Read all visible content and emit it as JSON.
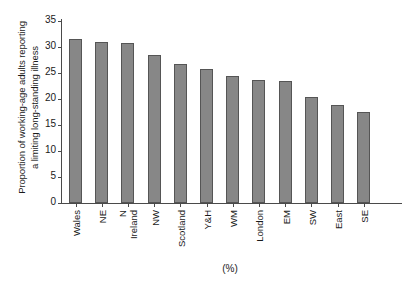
{
  "chart_data": {
    "type": "bar",
    "title": "",
    "subtitle": "",
    "categories": [
      "Wales",
      "NE",
      "N Ireland",
      "NW",
      "Scotland",
      "Y&H",
      "WM",
      "London",
      "EM",
      "SW",
      "East",
      "SE"
    ],
    "category_lines": [
      [
        "Wales"
      ],
      [
        "NE"
      ],
      [
        "N",
        "Ireland"
      ],
      [
        "NW"
      ],
      [
        "Scotland"
      ],
      [
        "Y&H"
      ],
      [
        "WM"
      ],
      [
        "London"
      ],
      [
        "EM"
      ],
      [
        "SW"
      ],
      [
        "East"
      ],
      [
        "SE"
      ]
    ],
    "values": [
      31.5,
      31.0,
      30.7,
      28.4,
      26.8,
      25.7,
      24.4,
      23.7,
      23.5,
      20.4,
      18.9,
      17.5
    ],
    "series": [
      {
        "name": "Proportion of working-age adults reporting a limiting long-standing illness",
        "values": [
          31.5,
          31.0,
          30.7,
          28.4,
          26.8,
          25.7,
          24.4,
          23.7,
          23.5,
          20.4,
          18.9,
          17.5
        ]
      }
    ],
    "ylabel_lines": [
      "Proportion of working-age adults reporting",
      "a limiting long-standing illness"
    ],
    "ylabel": "Proportion of working-age adults reporting a limiting long-standing illness",
    "xlabel": "(%)",
    "ylim": [
      0,
      35
    ],
    "yticks": [
      0,
      5,
      10,
      15,
      20,
      25,
      30,
      35
    ],
    "ytick_labels": [
      "0",
      "5",
      "10",
      "15",
      "20",
      "25",
      "30",
      "35"
    ],
    "grid": false,
    "legend": false,
    "legend_position": "none",
    "bar_color": "#878787",
    "bar_edge_color": "#555555",
    "axis_color": "#4a4a4a",
    "background_color": "#ffffff"
  }
}
